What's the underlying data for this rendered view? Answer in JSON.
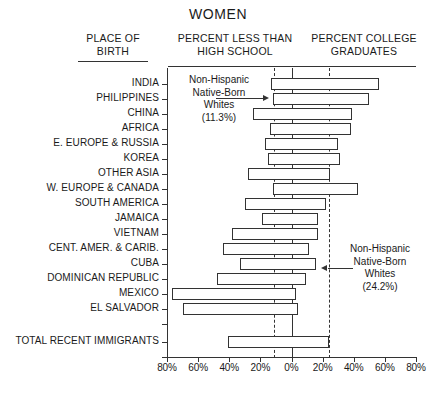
{
  "title": "WOMEN",
  "headers": {
    "place_of_birth": "PLACE OF\nBIRTH",
    "place_of_birth_line1": "PLACE OF",
    "place_of_birth_line2": "BIRTH",
    "less_than_hs_line1": "PERCENT LESS THAN",
    "less_than_hs_line2": "HIGH SCHOOL",
    "college_line1": "PERCENT COLLEGE",
    "college_line2": "GRADUATES"
  },
  "annotations": {
    "left": {
      "line1": "Non-Hispanic",
      "line2": "Native-Born",
      "line3": "Whites",
      "line4": "(11.3%)",
      "value": 11.3
    },
    "right": {
      "line1": "Non-Hispanic",
      "line2": "Native-Born",
      "line3": "Whites",
      "line4": "(24.2%)",
      "value": 24.2
    }
  },
  "axis": {
    "tick_labels": [
      "80%",
      "60%",
      "40%",
      "20%",
      "0%",
      "20%",
      "40%",
      "60%",
      "80%"
    ],
    "tick_values": [
      -80,
      -60,
      -40,
      -20,
      0,
      20,
      40,
      60,
      80
    ]
  },
  "chart_data": {
    "type": "bar",
    "orientation": "horizontal-diverging",
    "title": "WOMEN",
    "subtitle": "",
    "xlabel": "",
    "ylabel": "PLACE OF BIRTH",
    "xlim": [
      -80,
      80
    ],
    "grid": false,
    "legend": "none",
    "left_axis_label": "PERCENT LESS THAN HIGH SCHOOL",
    "right_axis_label": "PERCENT COLLEGE GRADUATES",
    "note": "Left side values are percent less than high school (plotted to the left of 0%); right side values are percent college graduates.",
    "reference_lines": [
      {
        "label": "Non-Hispanic Native-Born Whites (less than high school)",
        "value": -11.3,
        "style": "dashed"
      },
      {
        "label": "Non-Hispanic Native-Born Whites (college graduates)",
        "value": 24.2,
        "style": "dashed"
      }
    ],
    "categories": [
      "INDIA",
      "PHILIPPINES",
      "CHINA",
      "AFRICA",
      "E. EUROPE & RUSSIA",
      "KOREA",
      "OTHER ASIA",
      "W. EUROPE & CANADA",
      "SOUTH AMERICA",
      "JAMAICA",
      "VIETNAM",
      "CENT. AMER. & CARIB.",
      "CUBA",
      "DOMINICAN REPUBLIC",
      "MEXICO",
      "EL SALVADOR",
      "TOTAL RECENT IMMIGRANTS"
    ],
    "series": [
      {
        "name": "PERCENT LESS THAN HIGH SCHOOL",
        "side": "left",
        "values": [
          13,
          12,
          25,
          14,
          17,
          15,
          28,
          12,
          30,
          19,
          38,
          44,
          33,
          48,
          77,
          70,
          41
        ]
      },
      {
        "name": "PERCENT COLLEGE GRADUATES",
        "side": "right",
        "values": [
          56,
          50,
          39,
          38,
          30,
          31,
          25,
          43,
          22,
          17,
          17,
          11,
          16,
          9,
          3,
          4,
          24
        ]
      }
    ]
  }
}
